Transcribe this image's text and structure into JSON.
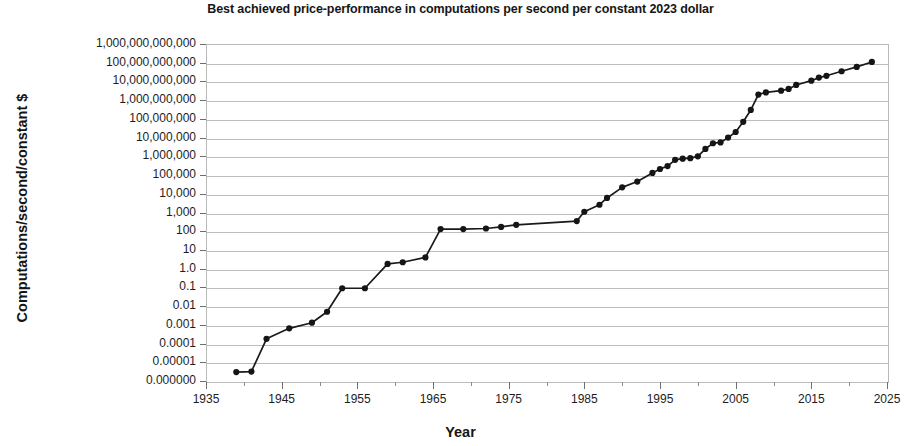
{
  "chart_data": {
    "type": "line",
    "title": "Best achieved price-performance in computations per second per constant 2023 dollar",
    "xlabel": "Year",
    "ylabel": "Computations/second/constant $",
    "xlim": [
      1935,
      2025
    ],
    "ylim": [
      1e-06,
      1000000000000
    ],
    "yscale": "log",
    "grid": true,
    "legend": null,
    "xticks": [
      1935,
      1945,
      1955,
      1965,
      1975,
      1985,
      1995,
      2005,
      2015,
      2025
    ],
    "xticks_minor": [
      1940,
      1950,
      1960,
      1970,
      1980,
      1990,
      2000,
      2010,
      2020
    ],
    "ytick_labels": [
      "1,000,000,000,000",
      "100,000,000,000",
      "10,000,000,000",
      "1,000,000,000",
      "100,000,000",
      "10,000,000",
      "1,000,000",
      "100,000",
      "10,000",
      "1,000",
      "100",
      "10",
      "1.0",
      "0.1",
      "0.01",
      "0.001",
      "0.0001",
      "0.00001",
      "0.000000"
    ],
    "ytick_values": [
      1000000000000.0,
      100000000000.0,
      10000000000.0,
      1000000000.0,
      100000000.0,
      10000000.0,
      1000000.0,
      100000.0,
      10000.0,
      1000.0,
      100.0,
      10.0,
      1.0,
      0.1,
      0.01,
      0.001,
      0.0001,
      1e-05,
      1e-06
    ],
    "series_name": "Best achieved price-performance",
    "marker": "circle",
    "color": "#151515",
    "x": [
      1939,
      1941,
      1943,
      1946,
      1949,
      1951,
      1953,
      1956,
      1959,
      1961,
      1964,
      1966,
      1969,
      1972,
      1974,
      1976,
      1984,
      1985,
      1987,
      1988,
      1990,
      1992,
      1994,
      1995,
      1996,
      1997,
      1998,
      1999,
      2000,
      2001,
      2002,
      2003,
      2004,
      2005,
      2006,
      2007,
      2008,
      2009,
      2011,
      2012,
      2013,
      2015,
      2016,
      2017,
      2019,
      2021,
      2023
    ],
    "y": [
      3e-06,
      3.2e-06,
      0.00018,
      0.00065,
      0.0013,
      0.005,
      0.09,
      0.09,
      1.8,
      2.2,
      4.0,
      130.0,
      130.0,
      140.0,
      170.0,
      220.0,
      350.0,
      1100.0,
      2600.0,
      6000.0,
      22000.0,
      45000.0,
      130000.0,
      210000.0,
      300000.0,
      650000.0,
      750000.0,
      800000.0,
      1000000.0,
      2500000.0,
      5000000.0,
      5500000.0,
      10000000.0,
      20000000.0,
      70000000.0,
      300000000.0,
      2000000000.0,
      2600000000.0,
      3200000000.0,
      4000000000.0,
      6500000000.0,
      11000000000.0,
      16000000000.0,
      20000000000.0,
      35000000000.0,
      60000000000.0,
      110000000000.0
    ]
  }
}
